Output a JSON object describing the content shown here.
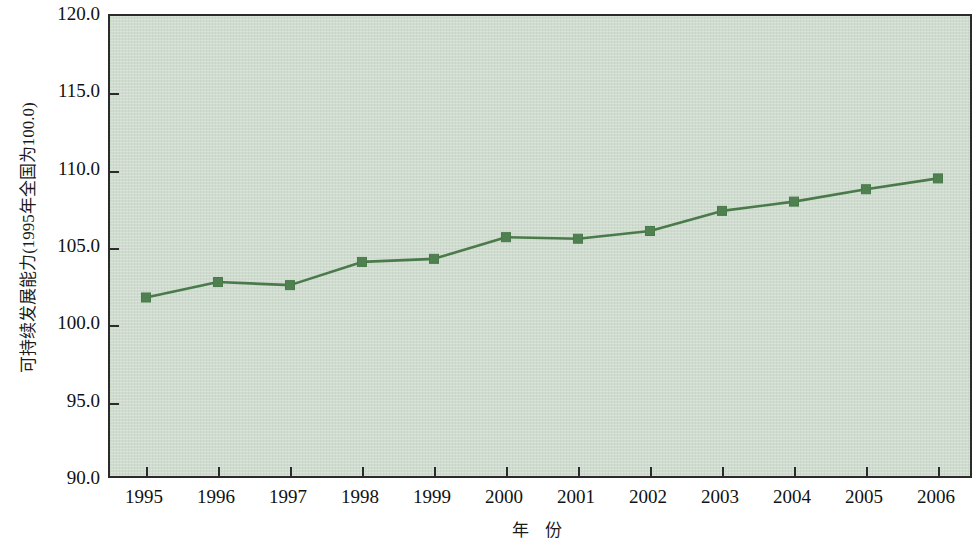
{
  "chart_data": {
    "type": "line",
    "title": "",
    "xlabel": "年 份",
    "ylabel": "可持续发展能力(1995年全国为100.0)",
    "categories": [
      "1995",
      "1996",
      "1997",
      "1998",
      "1999",
      "2000",
      "2001",
      "2002",
      "2003",
      "2004",
      "2005",
      "2006"
    ],
    "values": [
      101.8,
      102.8,
      102.6,
      104.1,
      104.3,
      105.7,
      105.6,
      106.1,
      107.4,
      108.0,
      108.8,
      109.5
    ],
    "series": [
      {
        "name": "可持续发展能力",
        "values": [
          101.8,
          102.8,
          102.6,
          104.1,
          104.3,
          105.7,
          105.6,
          106.1,
          107.4,
          108.0,
          108.8,
          109.5
        ]
      }
    ],
    "ylim": [
      90.0,
      120.0
    ],
    "y_ticks": [
      "90.0",
      "95.0",
      "100.0",
      "105.0",
      "110.0",
      "115.0",
      "120.0"
    ],
    "y_tick_values": [
      90.0,
      95.0,
      100.0,
      105.0,
      110.0,
      115.0,
      120.0
    ],
    "x_ticks": [
      "1995",
      "1996",
      "1997",
      "1998",
      "1999",
      "2000",
      "2001",
      "2002",
      "2003",
      "2004",
      "2005",
      "2006"
    ],
    "grid": false,
    "legend": "none",
    "marker": "square",
    "colors": {
      "line": "#4a7a4a",
      "marker": "#4f8050",
      "plot_background": "#cfdccf",
      "frame": "#2b2b2b",
      "page_background": "#ffffff",
      "text": "#111111"
    }
  }
}
